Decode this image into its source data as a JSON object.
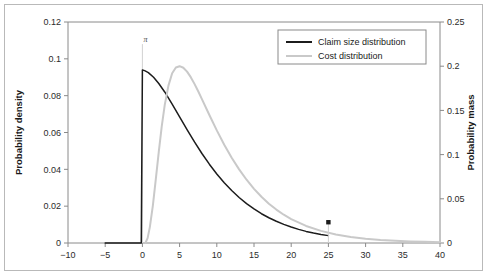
{
  "figure": {
    "background_color": "#ffffff",
    "frame_color": "#b9b9b9"
  },
  "chart_data": {
    "type": "line",
    "title": "",
    "xlabel": "",
    "ylabel": "Probability density",
    "y2label": "Probability mass",
    "xlim": [
      -10,
      40
    ],
    "ylim": [
      0,
      0.12
    ],
    "y2lim": [
      0,
      0.25
    ],
    "grid": false,
    "legend_position": "top-right-inside",
    "xticks": [
      -10,
      -5,
      0,
      5,
      10,
      15,
      20,
      25,
      30,
      35,
      40
    ],
    "xticklabels": [
      "−10",
      "−5",
      "0",
      "5",
      "10",
      "15",
      "20",
      "25",
      "30",
      "35",
      "40"
    ],
    "yticks": [
      0,
      0.02,
      0.04,
      0.06,
      0.08,
      0.1,
      0.12
    ],
    "yticklabels": [
      "0",
      "0.02",
      "0.04",
      "0.06",
      "0.08",
      "0.1",
      "0.12"
    ],
    "y2ticks": [
      0,
      0.05,
      0.1,
      0.15,
      0.2,
      0.25
    ],
    "y2ticklabels": [
      "0",
      "0.05",
      "0.1",
      "0.15",
      "0.2",
      "0.25"
    ],
    "series": [
      {
        "name": "Claim size distribution",
        "color": "#1c1c1c",
        "axis": "left",
        "x": [
          -5.0,
          -4.0,
          -3.0,
          -2.0,
          -1.0,
          -0.15,
          0.0,
          0.3,
          0.8,
          1.5,
          2.2,
          3.0,
          4.0,
          5.0,
          6.0,
          7.0,
          8.0,
          9.0,
          10.0,
          11.0,
          12.0,
          13.0,
          14.0,
          15.0,
          16.0,
          17.0,
          18.0,
          19.0,
          20.0,
          21.0,
          22.0,
          23.0,
          24.0,
          25.0
        ],
        "y": [
          0.0,
          0.0,
          0.0,
          0.0,
          0.0,
          0.0,
          0.094,
          0.0936,
          0.0925,
          0.09,
          0.0866,
          0.082,
          0.0754,
          0.0685,
          0.0616,
          0.0549,
          0.0486,
          0.0428,
          0.0375,
          0.0327,
          0.0285,
          0.0247,
          0.0214,
          0.0185,
          0.0159,
          0.0137,
          0.0118,
          0.0101,
          0.0087,
          0.0074,
          0.0063,
          0.0054,
          0.0046,
          0.004
        ]
      },
      {
        "name": "Cost distribution",
        "color": "#c9c9c9",
        "axis": "right",
        "x": [
          0.4,
          0.7,
          1.0,
          1.4,
          1.8,
          2.2,
          2.6,
          3.0,
          3.5,
          4.0,
          4.5,
          5.0,
          5.5,
          6.0,
          6.5,
          7.0,
          7.5,
          8.0,
          9.0,
          10.0,
          11.0,
          12.0,
          13.0,
          14.0,
          15.0,
          16.0,
          17.0,
          18.0,
          19.0,
          20.0,
          22.0,
          24.0,
          26.0,
          28.0,
          30.0,
          32.0,
          34.0,
          36.0,
          38.0,
          40.0
        ],
        "y": [
          0.0,
          0.0055,
          0.018,
          0.042,
          0.072,
          0.103,
          0.132,
          0.156,
          0.178,
          0.192,
          0.1985,
          0.2,
          0.1982,
          0.1938,
          0.1876,
          0.18,
          0.1716,
          0.1628,
          0.1448,
          0.1274,
          0.1112,
          0.0965,
          0.0833,
          0.0716,
          0.0613,
          0.0523,
          0.0445,
          0.0378,
          0.032,
          0.0271,
          0.0193,
          0.0137,
          0.0097,
          0.0069,
          0.0049,
          0.0035,
          0.0025,
          0.0018,
          0.0013,
          0.0009
        ]
      }
    ],
    "annotations": [
      {
        "name": "pi-annotation",
        "label": "π",
        "x": 0,
        "y_top": 0.108,
        "y_bottom": 0.0,
        "line_color": "#d2d2d2",
        "text_color": "#4a4a4a"
      },
      {
        "name": "marker-point",
        "label": "",
        "x": 25,
        "y_right_axis": 0.0235,
        "color": "#1c1c1c",
        "shape": "square"
      }
    ],
    "legend": {
      "entries": [
        {
          "label": "Claim size distribution",
          "color": "#1c1c1c"
        },
        {
          "label": "Cost distribution",
          "color": "#c9c9c9"
        }
      ]
    }
  }
}
